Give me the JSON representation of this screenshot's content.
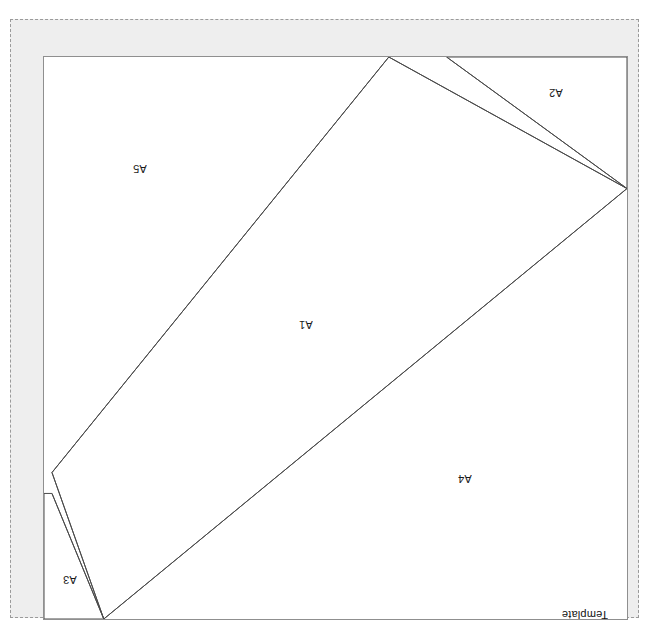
{
  "document": {
    "type": "pattern-template-sheet",
    "orientation_note": "rotated-180",
    "scan_header_text": "",
    "page_width": 649,
    "page_height": 629
  },
  "colors": {
    "page_background": "#ffffff",
    "margin_fill": "#eeeeee",
    "dashed_border": "#9a9a9a",
    "panel_background": "#ffffff",
    "panel_frame": "#8f8f8f",
    "cut_line": "#4a4a4a",
    "label_text": "#1a1a1a",
    "brand_bar_fill": "#000000",
    "brand_bar_text": "#ffffff"
  },
  "brand": {
    "name": "REVOLUTION",
    "subtitle": "Template"
  },
  "panel": {
    "x": 32,
    "y": 36,
    "width": 585,
    "height": 564
  },
  "pieces": [
    {
      "id": "A1",
      "label": "A1",
      "shape": "rotated-rectangle",
      "label_x": 291,
      "label_y": 306
    },
    {
      "id": "A2",
      "label": "A2",
      "shape": "triangle",
      "label_x": 541,
      "label_y": 74
    },
    {
      "id": "A3",
      "label": "A3",
      "shape": "triangle",
      "label_x": 55,
      "label_y": 561
    },
    {
      "id": "A4",
      "label": "A4",
      "shape": "quadrilateral",
      "label_x": 450,
      "label_y": 460
    },
    {
      "id": "A5",
      "label": "A5",
      "shape": "triangle",
      "label_x": 125,
      "label_y": 150
    }
  ],
  "cut_lines": [
    {
      "name": "a1-upper-left-edge",
      "x1": 346,
      "y1": 0,
      "x2": 8,
      "y2": 417
    },
    {
      "name": "a1-lower-right-edge",
      "x1": 585,
      "y1": 132,
      "x2": 60,
      "y2": 564
    },
    {
      "name": "a1-right-end",
      "x1": 346,
      "y1": 0,
      "x2": 585,
      "y2": 132
    },
    {
      "name": "a1-left-end",
      "x1": 8,
      "y1": 417,
      "x2": 60,
      "y2": 564
    },
    {
      "name": "a2-diagonal",
      "x1": 404,
      "y1": 0,
      "x2": 585,
      "y2": 132
    },
    {
      "name": "a3-diagonal",
      "x1": 8,
      "y1": 438,
      "x2": 60,
      "y2": 564
    }
  ],
  "scan_header": {
    "text": ""
  }
}
